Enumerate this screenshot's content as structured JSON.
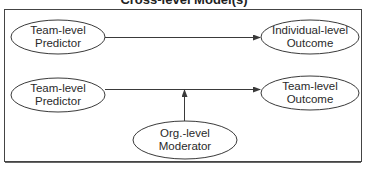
{
  "title": "Cross-level Model(s)",
  "colors": {
    "stroke": "#3a3a3a",
    "text": "#2a2a2a",
    "background": "#ffffff"
  },
  "nodes": [
    {
      "id": "n1",
      "line1": "Team-level",
      "line2": "Predictor",
      "cx": 58,
      "cy": 37
    },
    {
      "id": "n2",
      "line1": "Individual-level",
      "line2": "Outcome",
      "cx": 310,
      "cy": 37
    },
    {
      "id": "n3",
      "line1": "Team-level",
      "line2": "Predictor",
      "cx": 58,
      "cy": 95
    },
    {
      "id": "n4",
      "line1": "Team-level",
      "line2": "Outcome",
      "cx": 310,
      "cy": 93
    },
    {
      "id": "n5",
      "line1": "Org.-level",
      "line2": "Moderator",
      "cx": 185,
      "cy": 140
    }
  ],
  "edges": [
    {
      "from": "Team-level Predictor",
      "to": "Individual-level Outcome",
      "type": "direct"
    },
    {
      "from": "Team-level Predictor",
      "to": "Team-level Outcome",
      "type": "direct"
    },
    {
      "from": "Org.-level Moderator",
      "to": "Team-level Predictor → Team-level Outcome path",
      "type": "moderation"
    }
  ]
}
